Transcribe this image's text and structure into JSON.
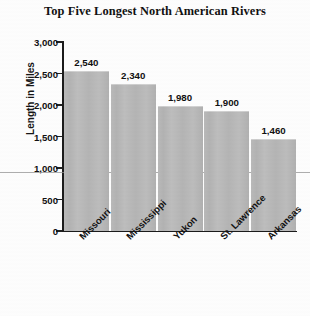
{
  "chart_data": {
    "type": "bar",
    "title": "Top Five Longest North American Rivers",
    "xlabel": "",
    "ylabel": "Length in Miles",
    "categories": [
      "Missouri",
      "Mississippi",
      "Yukon",
      "St. Lawrence",
      "Arkansas"
    ],
    "values": [
      2540,
      2340,
      1980,
      1900,
      1460
    ],
    "value_labels": [
      "2,540",
      "2,340",
      "1,980",
      "1,900",
      "1,460"
    ],
    "ylim": [
      0,
      3000
    ],
    "y_tick_values": [
      3000,
      2500,
      2000,
      1500,
      1000,
      500,
      0
    ],
    "y_tick_labels": [
      "3,000",
      "2,500",
      "2,000",
      "1,500",
      "1,000",
      "500",
      "0"
    ],
    "grid": false,
    "legend": null,
    "bar_color": "#b5b5b5",
    "axis_color": "#1b1b1b",
    "text_color": "#111111"
  }
}
